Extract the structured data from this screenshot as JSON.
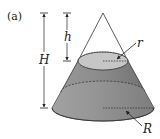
{
  "figure": {
    "panel_label": "(a)",
    "labels": {
      "total_height": "H",
      "top_height": "h",
      "small_radius": "r",
      "large_radius": "R"
    },
    "colors": {
      "frustum_dark": "#7a7a7a",
      "frustum_light": "#bdbdbd",
      "top_face": "#c8c8c8",
      "line": "#333333"
    },
    "shape": "cone truncated by plane (frustum) with removed upper cone"
  }
}
